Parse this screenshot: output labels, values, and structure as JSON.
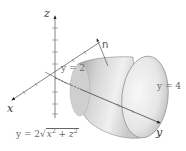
{
  "figure": {
    "type": "3d-surface-diagram",
    "axes": {
      "x_label": "x",
      "y_label": "y",
      "z_label": "z"
    },
    "labels": {
      "normal": "n",
      "plane_near": "y = 2",
      "plane_far": "y = 4",
      "surface_equation_lhs": "y = 2",
      "surface_equation_radicand_x": "x",
      "surface_equation_exp_x": "2",
      "surface_equation_plus": " + ",
      "surface_equation_radicand_z": "z",
      "surface_equation_exp_z": "2"
    },
    "colors": {
      "axis": "#555555",
      "surface_light": "#f2f2f2",
      "surface_dark": "#a8a8a8",
      "edge": "#888888",
      "text": "#555555"
    }
  }
}
